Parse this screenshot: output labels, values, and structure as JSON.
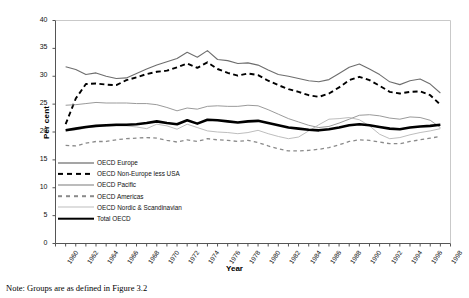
{
  "figure": {
    "note": "Note: Groups are as defined in Figure 3.2"
  },
  "chart_data": {
    "type": "line",
    "title": "",
    "xlabel": "Year",
    "ylabel": "Per cent",
    "xlim": [
      1960,
      1999
    ],
    "ylim": [
      0,
      40
    ],
    "yticks": [
      0,
      5,
      10,
      15,
      20,
      25,
      30,
      35,
      40
    ],
    "grid": false,
    "legend_position": "inside-lower-left",
    "x": [
      1961,
      1962,
      1963,
      1964,
      1965,
      1966,
      1967,
      1968,
      1969,
      1970,
      1971,
      1972,
      1973,
      1974,
      1975,
      1976,
      1977,
      1978,
      1979,
      1980,
      1981,
      1982,
      1983,
      1984,
      1985,
      1986,
      1987,
      1988,
      1989,
      1990,
      1991,
      1992,
      1993,
      1994,
      1995,
      1996,
      1997,
      1998
    ],
    "xtick_labels": [
      "1960",
      "1962",
      "1964",
      "1966",
      "1968",
      "1970",
      "1972",
      "1974",
      "1976",
      "1978",
      "1980",
      "1982",
      "1984",
      "1986",
      "1988",
      "1990",
      "1992",
      "1994",
      "1996",
      "1998"
    ],
    "series": [
      {
        "name": "OECD Europe",
        "style": "solid",
        "color": "#6e6e6e",
        "width": 1.1,
        "values": [
          31.7,
          31.2,
          30.3,
          30.6,
          30.0,
          29.6,
          29.7,
          30.5,
          31.3,
          32.0,
          32.6,
          33.2,
          34.3,
          33.4,
          34.6,
          33.0,
          32.8,
          32.3,
          32.4,
          32.0,
          31.1,
          30.3,
          30.0,
          29.6,
          29.2,
          29.0,
          29.4,
          30.5,
          31.6,
          32.2,
          31.3,
          30.3,
          29.0,
          28.5,
          29.2,
          29.5,
          28.6,
          27.0
        ]
      },
      {
        "name": "OECD Non-Europe less USA",
        "style": "dashed",
        "color": "#000000",
        "width": 1.9,
        "values": [
          21.4,
          26.0,
          28.6,
          28.7,
          28.5,
          28.4,
          29.3,
          29.8,
          30.4,
          30.8,
          31.0,
          31.6,
          32.3,
          31.5,
          32.5,
          31.3,
          30.6,
          30.1,
          30.5,
          30.2,
          29.2,
          28.4,
          27.7,
          27.2,
          26.6,
          26.3,
          26.9,
          28.0,
          29.3,
          29.9,
          29.3,
          28.3,
          27.2,
          26.9,
          27.2,
          27.3,
          26.6,
          24.9
        ]
      },
      {
        "name": "OECD Pacific",
        "style": "solid",
        "color": "#8f8f8f",
        "width": 0.9,
        "values": [
          24.8,
          24.9,
          25.1,
          25.3,
          25.2,
          25.2,
          25.2,
          25.1,
          25.1,
          24.9,
          24.4,
          23.8,
          24.3,
          24.1,
          24.6,
          24.7,
          24.6,
          24.6,
          24.8,
          24.7,
          24.0,
          23.2,
          22.4,
          21.8,
          21.2,
          20.8,
          21.0,
          21.6,
          22.3,
          23.0,
          23.1,
          22.9,
          22.5,
          22.3,
          22.7,
          22.6,
          22.1,
          20.8
        ]
      },
      {
        "name": "OECD Americas",
        "style": "dashed",
        "color": "#8a8a8a",
        "width": 1.3,
        "values": [
          17.6,
          17.5,
          18.0,
          18.3,
          18.3,
          18.6,
          18.8,
          18.9,
          19.0,
          18.9,
          18.5,
          18.2,
          18.6,
          18.3,
          18.8,
          18.6,
          18.5,
          18.3,
          18.5,
          18.1,
          17.5,
          17.0,
          16.6,
          16.6,
          16.7,
          16.9,
          17.2,
          17.7,
          18.3,
          18.6,
          18.5,
          18.2,
          17.9,
          17.9,
          18.3,
          18.6,
          18.9,
          19.2
        ]
      },
      {
        "name": "OECD Nordic & Scandinavian",
        "style": "solid",
        "color": "#b5b5b5",
        "width": 0.9,
        "values": [
          20.2,
          20.4,
          20.7,
          21.0,
          21.0,
          21.1,
          21.1,
          20.9,
          20.6,
          21.4,
          21.1,
          20.5,
          21.4,
          20.8,
          20.2,
          20.0,
          19.9,
          19.7,
          19.9,
          20.3,
          19.7,
          19.2,
          18.8,
          19.1,
          20.2,
          21.3,
          22.3,
          22.4,
          22.6,
          22.2,
          21.1,
          19.6,
          18.8,
          19.0,
          19.5,
          19.9,
          20.2,
          20.6
        ]
      },
      {
        "name": "Total OECD",
        "style": "solid",
        "color": "#000000",
        "width": 2.6,
        "values": [
          20.3,
          20.6,
          20.9,
          21.1,
          21.2,
          21.3,
          21.3,
          21.4,
          21.6,
          21.9,
          21.6,
          21.4,
          22.1,
          21.5,
          22.2,
          22.1,
          21.9,
          21.7,
          21.9,
          22.0,
          21.6,
          21.2,
          20.8,
          20.6,
          20.4,
          20.3,
          20.5,
          20.8,
          21.2,
          21.4,
          21.2,
          20.9,
          20.6,
          20.5,
          20.8,
          21.0,
          21.1,
          21.3
        ]
      }
    ]
  }
}
